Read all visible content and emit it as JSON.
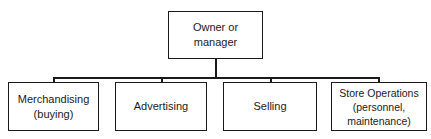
{
  "diagram": {
    "type": "org-chart",
    "root": {
      "label": "Owner or\nmanager"
    },
    "children": [
      {
        "label": "Merchandising\n(buying)"
      },
      {
        "label": "Advertising"
      },
      {
        "label": "Selling"
      },
      {
        "label": "Store Operations\n(personnel,\nmaintenance)"
      }
    ],
    "edges": [
      {
        "from": "Owner or manager",
        "to": "Merchandising (buying)"
      },
      {
        "from": "Owner or manager",
        "to": "Advertising"
      },
      {
        "from": "Owner or manager",
        "to": "Selling"
      },
      {
        "from": "Owner or manager",
        "to": "Store Operations (personnel, maintenance)"
      }
    ],
    "colors": {
      "line": "#1a1a1a",
      "background": "#ffffff"
    }
  }
}
